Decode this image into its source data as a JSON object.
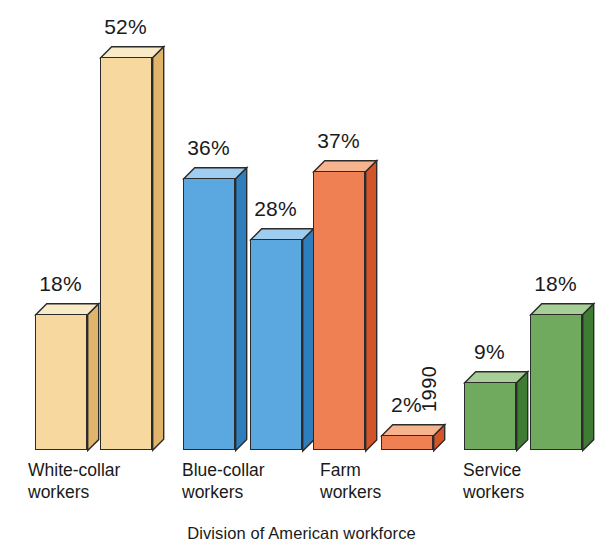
{
  "caption": "Division of American workforce",
  "chart_data": {
    "type": "bar",
    "title": "Division of American workforce",
    "subtitle": "",
    "xlabel": "",
    "ylabel": "",
    "ylim": [
      0,
      56
    ],
    "grid": false,
    "legend": "none",
    "value_suffix": "%",
    "categories": [
      "White-collar workers",
      "Blue-collar workers",
      "Farm workers",
      "Service workers"
    ],
    "series": [
      {
        "name": "1900",
        "values": [
          18,
          36,
          37,
          9
        ]
      },
      {
        "name": "1990",
        "values": [
          52,
          28,
          2,
          18
        ]
      }
    ],
    "annotations": [
      "Bars drawn in 3D isometric style",
      "Year labels printed vertically inside each bar",
      "The 2% Farm 1990 bar is too short, so its year label sits above the bar"
    ]
  },
  "groups": [
    {
      "name": "white-collar",
      "label": "White-collar\nworkers",
      "colors": {
        "front": "#F7D9A0",
        "top": "#FAEBC8",
        "side": "#E0B46A"
      },
      "label_left": 28,
      "bars": [
        {
          "year": "1900",
          "value": "18%",
          "pct": 18,
          "left": 35,
          "width": 52,
          "year_inside": true
        },
        {
          "year": "1990",
          "value": "52%",
          "pct": 52,
          "left": 100,
          "width": 52,
          "year_inside": true
        }
      ]
    },
    {
      "name": "blue-collar",
      "label": "Blue-collar\nworkers",
      "colors": {
        "front": "#5BA8E0",
        "top": "#9ECDF0",
        "side": "#2E7DBC"
      },
      "label_left": 182,
      "bars": [
        {
          "year": "1900",
          "value": "36%",
          "pct": 36,
          "left": 183,
          "width": 52,
          "year_inside": true
        },
        {
          "year": "1990",
          "value": "28%",
          "pct": 28,
          "left": 250,
          "width": 52,
          "year_inside": true
        }
      ]
    },
    {
      "name": "farm",
      "label": "Farm\nworkers",
      "colors": {
        "front": "#EE8054",
        "top": "#F6B48E",
        "side": "#D2542A"
      },
      "label_left": 320,
      "bars": [
        {
          "year": "1900",
          "value": "37%",
          "pct": 37,
          "left": 313,
          "width": 52,
          "year_inside": true
        },
        {
          "year": "1990",
          "value": "2%",
          "pct": 2,
          "left": 381,
          "width": 52,
          "year_inside": false
        }
      ]
    },
    {
      "name": "service",
      "label": "Service\nworkers",
      "colors": {
        "front": "#6FAA5E",
        "top": "#A7CE96",
        "side": "#3F7C33"
      },
      "label_left": 463,
      "bars": [
        {
          "year": "1900",
          "value": "9%",
          "pct": 9,
          "left": 464,
          "width": 52,
          "year_inside": true
        },
        {
          "year": "1990",
          "value": "18%",
          "pct": 18,
          "left": 530,
          "width": 52,
          "year_inside": true
        }
      ]
    }
  ]
}
